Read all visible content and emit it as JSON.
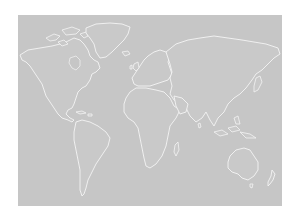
{
  "map": {
    "title": "World map",
    "projection": "equirectangular",
    "style": "white coastlines on gray",
    "colors": {
      "background": "#ffffff",
      "ocean": "#c6c6c6",
      "land": "#c9c9c9",
      "coastline": "#f4f4f4"
    },
    "regions": [
      {
        "name": "North America"
      },
      {
        "name": "Greenland"
      },
      {
        "name": "South America"
      },
      {
        "name": "Europe"
      },
      {
        "name": "Africa"
      },
      {
        "name": "Asia"
      },
      {
        "name": "Australia"
      },
      {
        "name": "New Zealand"
      }
    ]
  }
}
